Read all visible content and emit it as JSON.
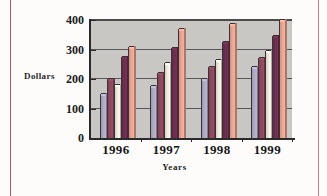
{
  "chart_data": {
    "type": "bar",
    "title": "",
    "subtitle": "",
    "xlabel": "Years",
    "ylabel": "Dollars",
    "categories": [
      "1996",
      "1997",
      "1998",
      "1999"
    ],
    "ylim": [
      0,
      400
    ],
    "yticks": [
      0,
      100,
      200,
      300,
      400
    ],
    "ytick_labels": [
      "0",
      "100",
      "200",
      "300",
      "400"
    ],
    "grid": true,
    "grid_axis": "y",
    "legend": false,
    "legend_position": "none",
    "plot_background": "#c9c7c4",
    "series": [
      {
        "name": "Series 1",
        "color": "#b0aac4",
        "values": [
          150,
          175,
          200,
          240
        ]
      },
      {
        "name": "Series 2",
        "color": "#8e4a5e",
        "values": [
          200,
          220,
          240,
          270
        ]
      },
      {
        "name": "Series 3",
        "color": "#efeade",
        "values": [
          180,
          255,
          265,
          295
        ]
      },
      {
        "name": "Series 4",
        "color": "#6d2f50",
        "values": [
          275,
          305,
          325,
          345
        ]
      },
      {
        "name": "Series 5",
        "color": "#e9a693",
        "values": [
          310,
          370,
          385,
          400
        ]
      }
    ]
  },
  "axis": {
    "y_label": "Dollars",
    "x_label": "Years",
    "y_tick_0": "0",
    "y_tick_100": "100",
    "y_tick_200": "200",
    "y_tick_300": "300",
    "y_tick_400": "400",
    "x_tick_0": "1996",
    "x_tick_1": "1997",
    "x_tick_2": "1998",
    "x_tick_3": "1999"
  }
}
